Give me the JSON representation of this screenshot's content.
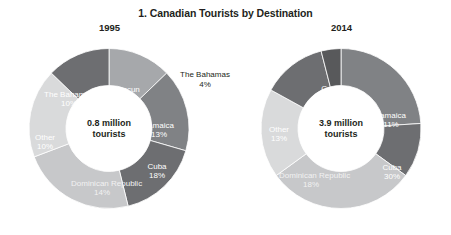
{
  "chart_data": {
    "type": "pie",
    "title": "1. Canadian Tourists by Destination",
    "xlabel": "",
    "ylabel": "",
    "legend_position": "none",
    "grid": false,
    "note": "Two donut charts comparing share of Canadian tourists by destination in 1995 and 2014.",
    "charts": [
      {
        "year": "1995",
        "center_line1": "0.8 million",
        "center_line2": "tourists",
        "total": "0.8 million tourists",
        "categories": [
          "The Bahamas",
          "Cancun",
          "Jamaica",
          "Cuba",
          "Dominican Republic",
          "Other"
        ],
        "values": [
          10,
          13,
          13,
          18,
          14,
          10
        ],
        "slices": [
          {
            "label": "The Bahamas",
            "value": "10",
            "pct": "10%",
            "color": "#a6a8ab"
          },
          {
            "label": "Cancun",
            "value": "13",
            "pct": "13%",
            "color": "#808285"
          },
          {
            "label": "Jamaica",
            "value": "13",
            "pct": "13%",
            "color": "#6d6e71"
          },
          {
            "label": "Cuba",
            "value": "18",
            "pct": "18%",
            "color": "#c7c8ca"
          },
          {
            "label": "Dominican Republic",
            "value": "14",
            "pct": "14%",
            "color": "#d9dadb"
          },
          {
            "label": "Other",
            "value": "10",
            "pct": "10%",
            "color": "#6d6e71"
          }
        ]
      },
      {
        "year": "2014",
        "center_line1": "3.9 million",
        "center_line2": "tourists",
        "total": "3.9 million tourists",
        "categories": [
          "Cancun",
          "Jamaica",
          "Cuba",
          "Dominican Republic",
          "Other",
          "The Bahamas"
        ],
        "values": [
          24,
          11,
          30,
          18,
          13,
          4
        ],
        "slices": [
          {
            "label": "Cancun",
            "value": "24",
            "pct": "24%",
            "color": "#808285"
          },
          {
            "label": "Jamaica",
            "value": "11",
            "pct": "11%",
            "color": "#6d6e71"
          },
          {
            "label": "Cuba",
            "value": "30",
            "pct": "30%",
            "color": "#c7c8ca"
          },
          {
            "label": "Dominican Republic",
            "value": "18",
            "pct": "18%",
            "color": "#d9dadb"
          },
          {
            "label": "Other",
            "value": "13",
            "pct": "13%",
            "color": "#6d6e71"
          },
          {
            "label": "The Bahamas",
            "value": "4",
            "pct": "4%",
            "color": "#58595b"
          }
        ],
        "external_label": {
          "label": "The Bahamas",
          "pct": "4%"
        }
      }
    ]
  }
}
